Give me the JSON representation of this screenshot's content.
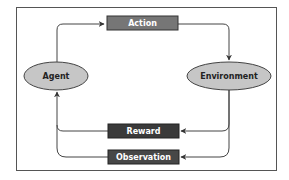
{
  "diagram": {
    "type": "reinforcement-learning-loop",
    "nodes": {
      "agent": {
        "label": "Agent",
        "shape": "ellipse",
        "fill": "#c6c6c6"
      },
      "environment": {
        "label": "Environment",
        "shape": "ellipse",
        "fill": "#c6c6c6"
      },
      "action": {
        "label": "Action",
        "shape": "rect",
        "fill": "#767676"
      },
      "reward": {
        "label": "Reward",
        "shape": "rect",
        "fill": "#3a3a3a"
      },
      "observation": {
        "label": "Observation",
        "shape": "rect",
        "fill": "#474747"
      }
    },
    "edges": [
      {
        "from": "Agent",
        "to": "Action"
      },
      {
        "from": "Action",
        "to": "Environment"
      },
      {
        "from": "Environment",
        "to": "Reward"
      },
      {
        "from": "Environment",
        "to": "Observation"
      },
      {
        "from": "Reward",
        "to": "Agent"
      },
      {
        "from": "Observation",
        "to": "Agent"
      }
    ],
    "colors": {
      "frame_border": "#555555",
      "edge": "#444444",
      "ellipse_stroke": "#444444",
      "rect_label_text": "#ffffff",
      "ellipse_label_text": "#222222"
    }
  }
}
